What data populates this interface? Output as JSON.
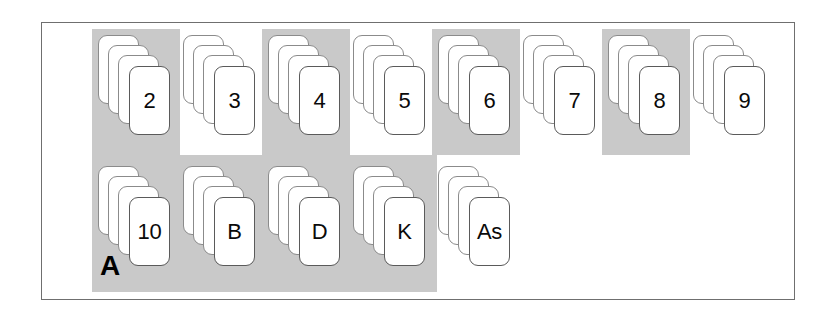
{
  "figure": {
    "region_label": "A",
    "highlight_color": "#c9c9c9",
    "card_face_color": "#ffffff",
    "card_border_color": "#8b8b8b",
    "frame_color": "#6f6f6f",
    "cards_per_stack": 4
  },
  "rows": [
    {
      "name": "top-row",
      "stacks": [
        {
          "label": "2",
          "highlighted": true,
          "x": 98,
          "y": 35
        },
        {
          "label": "3",
          "highlighted": false,
          "x": 183,
          "y": 35
        },
        {
          "label": "4",
          "highlighted": true,
          "x": 268,
          "y": 35
        },
        {
          "label": "5",
          "highlighted": false,
          "x": 353,
          "y": 35
        },
        {
          "label": "6",
          "highlighted": true,
          "x": 438,
          "y": 35
        },
        {
          "label": "7",
          "highlighted": false,
          "x": 523,
          "y": 35
        },
        {
          "label": "8",
          "highlighted": true,
          "x": 608,
          "y": 35
        },
        {
          "label": "9",
          "highlighted": false,
          "x": 693,
          "y": 35
        }
      ]
    },
    {
      "name": "bottom-row",
      "stacks": [
        {
          "label": "10",
          "highlighted": true,
          "x": 98,
          "y": 166
        },
        {
          "label": "B",
          "highlighted": true,
          "x": 183,
          "y": 166
        },
        {
          "label": "D",
          "highlighted": true,
          "x": 268,
          "y": 166
        },
        {
          "label": "K",
          "highlighted": true,
          "x": 353,
          "y": 166
        },
        {
          "label": "As",
          "highlighted": false,
          "x": 438,
          "y": 166
        }
      ]
    }
  ],
  "highlight_blocks": [
    {
      "name": "block-top-2",
      "x": 92,
      "y": 29,
      "w": 88,
      "h": 126
    },
    {
      "name": "block-top-4",
      "x": 262,
      "y": 29,
      "w": 88,
      "h": 126
    },
    {
      "name": "block-top-6",
      "x": 432,
      "y": 29,
      "w": 88,
      "h": 126
    },
    {
      "name": "block-top-8",
      "x": 602,
      "y": 29,
      "w": 88,
      "h": 126
    },
    {
      "name": "block-bottom-band",
      "x": 92,
      "y": 155,
      "w": 345,
      "h": 137
    }
  ]
}
